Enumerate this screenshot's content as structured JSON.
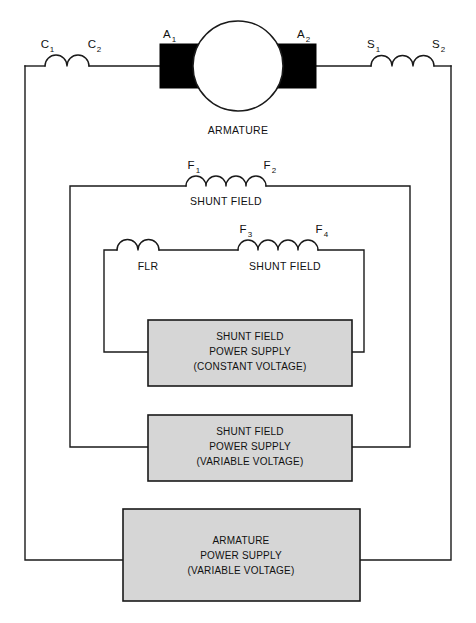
{
  "diagram": {
    "background_color": "#ffffff",
    "wire_color": "#1a1a1a",
    "box_fill_color": "#d6d6d6",
    "brush_color": "#000000"
  },
  "armature": {
    "caption": "ARMATURE",
    "terminal_left": "A",
    "terminal_left_sub": "1",
    "terminal_right": "A",
    "terminal_right_sub": "2"
  },
  "coils": {
    "commutating": {
      "name": "commutating-field-coil",
      "terminal_left": "C",
      "terminal_left_sub": "1",
      "terminal_right": "C",
      "terminal_right_sub": "2",
      "caption": "",
      "bumps": 2
    },
    "series": {
      "name": "series-field-coil",
      "terminal_left": "S",
      "terminal_left_sub": "1",
      "terminal_right": "S",
      "terminal_right_sub": "2",
      "caption": "",
      "bumps": 3
    },
    "shunt_field_1": {
      "name": "shunt-field-coil-f1-f2",
      "terminal_left": "F",
      "terminal_left_sub": "1",
      "terminal_right": "F",
      "terminal_right_sub": "2",
      "caption": "SHUNT FIELD",
      "bumps": 4
    },
    "flr": {
      "name": "field-loss-relay-coil",
      "terminal_left": "",
      "terminal_left_sub": "",
      "terminal_right": "",
      "terminal_right_sub": "",
      "caption": "FLR",
      "bumps": 2
    },
    "shunt_field_2": {
      "name": "shunt-field-coil-f3-f4",
      "terminal_left": "F",
      "terminal_left_sub": "3",
      "terminal_right": "F",
      "terminal_right_sub": "4",
      "caption": "SHUNT FIELD",
      "bumps": 4
    }
  },
  "supplies": [
    {
      "id": "shunt-field-constant",
      "line1": "SHUNT FIELD",
      "line2": "POWER SUPPLY",
      "line3": "(CONSTANT VOLTAGE)"
    },
    {
      "id": "shunt-field-variable",
      "line1": "SHUNT FIELD",
      "line2": "POWER SUPPLY",
      "line3": "(VARIABLE VOLTAGE)"
    },
    {
      "id": "armature-variable",
      "line1": "ARMATURE",
      "line2": "POWER SUPPLY",
      "line3": "(VARIABLE VOLTAGE)"
    }
  ]
}
